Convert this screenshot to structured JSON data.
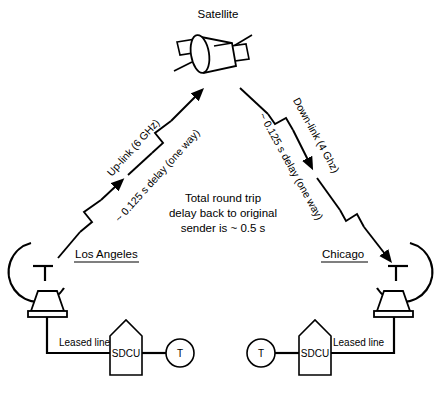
{
  "diagram": {
    "title_text": "Satellite",
    "nodes": {
      "satellite": {
        "label": "Satellite",
        "icon": "satellite-icon"
      },
      "los_angeles": {
        "label": "Los Angeles",
        "dish_icon": "satellite-dish-icon",
        "leased_line_label": "Leased line",
        "sdcu_label": "SDCU",
        "terminal_label": "T"
      },
      "chicago": {
        "label": "Chicago",
        "dish_icon": "satellite-dish-icon",
        "leased_line_label": "Leased line",
        "sdcu_label": "SDCU",
        "terminal_label": "T"
      }
    },
    "links": {
      "uplink": {
        "name_label": "Up-link (6 GHz)",
        "delay_label": "~ 0.125 s delay (one way)",
        "direction": "los-angeles-to-satellite",
        "frequency": "6 GHz",
        "delay_seconds": 0.125
      },
      "downlink": {
        "name_label": "Down-link (4 Ghz)",
        "delay_label": "~ 0.125 s delay (one way)",
        "direction": "satellite-to-chicago",
        "frequency": "4 Ghz",
        "delay_seconds": 0.125
      }
    },
    "center_note": {
      "line1": "Total round trip",
      "line2": "delay back to original",
      "line3": "sender is ~ 0.5 s",
      "round_trip_seconds": 0.5
    },
    "colors": {
      "ink": "#000000",
      "paper": "#ffffff"
    }
  }
}
